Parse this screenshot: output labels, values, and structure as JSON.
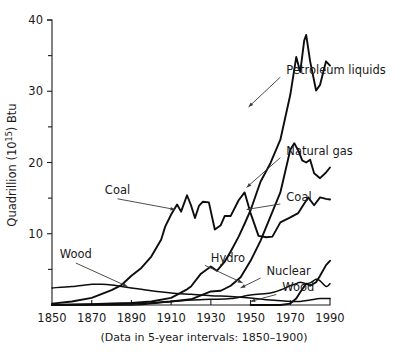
{
  "chart_data": {
    "type": "line",
    "title": "",
    "subtitle": "",
    "xlabel": "",
    "ylabel": "Quadrillion (10^15) Btu",
    "ylabel_parts": {
      "prefix": "Quadrillion (10",
      "exponent": "15",
      "suffix": ") Btu"
    },
    "caption": "(Data in 5-year intervals:  1850–1900)",
    "xlim": [
      1850,
      1990
    ],
    "ylim": [
      0,
      40
    ],
    "xticks": [
      1850,
      1870,
      1890,
      1910,
      1930,
      1950,
      1970,
      1990
    ],
    "xticklabels": [
      "1850",
      "1870",
      "1890",
      "1910",
      "1930",
      "1950",
      "1970",
      "1990"
    ],
    "yticks": [
      10,
      20,
      30,
      40
    ],
    "yticklabels": [
      "10",
      "20",
      "30",
      "40"
    ],
    "yminorticks": [
      5,
      15,
      25,
      35
    ],
    "grid": false,
    "legend_position": "inline-annotations",
    "line_color": "#0d0d0d",
    "axis_color": "#1c1c1c",
    "series": [
      {
        "name": "Wood",
        "x": [
          1850,
          1860,
          1870,
          1875,
          1880,
          1885,
          1890,
          1895,
          1900,
          1910,
          1920,
          1930,
          1940,
          1950,
          1960,
          1970,
          1975,
          1980,
          1985,
          1990
        ],
        "values": [
          2.4,
          2.6,
          2.9,
          2.9,
          2.8,
          2.6,
          2.4,
          2.2,
          2.0,
          1.7,
          1.5,
          1.3,
          1.2,
          1.0,
          0.7,
          0.5,
          0.5,
          0.7,
          0.9,
          0.9
        ]
      },
      {
        "name": "Coal",
        "x": [
          1850,
          1860,
          1870,
          1880,
          1885,
          1890,
          1895,
          1900,
          1905,
          1907,
          1910,
          1913,
          1915,
          1918,
          1920,
          1922,
          1924,
          1926,
          1929,
          1932,
          1935,
          1937,
          1940,
          1944,
          1947,
          1950,
          1954,
          1958,
          1961,
          1965,
          1970,
          1974,
          1976,
          1979,
          1982,
          1985,
          1988,
          1990
        ],
        "values": [
          0.2,
          0.5,
          1.0,
          2.1,
          2.8,
          4.1,
          5.2,
          6.8,
          9.2,
          11.0,
          12.7,
          14.1,
          13.1,
          15.4,
          14.0,
          12.2,
          13.9,
          14.5,
          14.4,
          10.6,
          11.2,
          12.5,
          12.5,
          14.7,
          15.8,
          12.9,
          9.7,
          9.5,
          9.6,
          11.6,
          12.3,
          12.9,
          13.8,
          15.1,
          14.0,
          15.1,
          14.9,
          14.8
        ]
      },
      {
        "name": "Petroleum liquids",
        "x": [
          1850,
          1870,
          1880,
          1890,
          1900,
          1910,
          1918,
          1920,
          1925,
          1930,
          1933,
          1937,
          1940,
          1944,
          1947,
          1950,
          1955,
          1960,
          1965,
          1970,
          1973,
          1975,
          1977,
          1978,
          1980,
          1983,
          1985,
          1988,
          1990
        ],
        "values": [
          0.0,
          0.1,
          0.2,
          0.3,
          0.5,
          1.0,
          2.2,
          2.6,
          4.4,
          5.4,
          4.8,
          6.1,
          7.5,
          9.6,
          11.4,
          13.3,
          17.3,
          19.9,
          23.2,
          29.5,
          34.8,
          32.7,
          37.1,
          37.9,
          34.2,
          30.1,
          30.9,
          34.2,
          33.6
        ]
      },
      {
        "name": "Natural gas",
        "x": [
          1850,
          1880,
          1890,
          1900,
          1910,
          1920,
          1930,
          1935,
          1940,
          1945,
          1950,
          1955,
          1960,
          1965,
          1970,
          1972,
          1974,
          1976,
          1978,
          1980,
          1982,
          1985,
          1988,
          1990
        ],
        "values": [
          0.0,
          0.1,
          0.2,
          0.3,
          0.5,
          0.8,
          1.9,
          2.0,
          2.7,
          3.9,
          6.2,
          9.0,
          12.4,
          15.8,
          21.8,
          22.7,
          21.7,
          20.3,
          20.0,
          20.4,
          18.5,
          17.8,
          18.6,
          19.3
        ]
      },
      {
        "name": "Hydro",
        "x": [
          1850,
          1890,
          1900,
          1910,
          1920,
          1930,
          1940,
          1950,
          1960,
          1965,
          1970,
          1973,
          1975,
          1978,
          1980,
          1983,
          1985,
          1988,
          1990
        ],
        "values": [
          0.0,
          0.0,
          0.2,
          0.5,
          0.7,
          0.8,
          0.9,
          1.4,
          1.7,
          2.1,
          2.7,
          3.0,
          3.2,
          3.0,
          3.1,
          3.6,
          3.4,
          2.6,
          3.0
        ]
      },
      {
        "name": "Nuclear",
        "x": [
          1950,
          1960,
          1965,
          1970,
          1973,
          1975,
          1978,
          1980,
          1983,
          1985,
          1988,
          1990
        ],
        "values": [
          0.0,
          0.0,
          0.0,
          0.2,
          0.9,
          1.8,
          3.0,
          2.7,
          3.2,
          4.1,
          5.6,
          6.2
        ]
      }
    ],
    "annotations": [
      {
        "label": "Coal",
        "side": "left",
        "text_x": 1883,
        "text_y": 15.6,
        "point_x": 1912,
        "point_y": 13.4
      },
      {
        "label": "Wood",
        "side": "left",
        "text_x": 1862,
        "text_y": 6.6,
        "point_x": 1888,
        "point_y": 2.6
      },
      {
        "label": "Petroleum liquids",
        "side": "right",
        "text_x": 1968,
        "text_y": 32.4,
        "point_x": 1949,
        "point_y": 27.8
      },
      {
        "label": "Natural gas",
        "side": "right",
        "text_x": 1968,
        "text_y": 21.1,
        "point_x": 1948,
        "point_y": 16.5
      },
      {
        "label": "Coal",
        "side": "right",
        "text_x": 1968,
        "text_y": 14.6,
        "point_x": 1948,
        "point_y": 13.4
      },
      {
        "label": "Hydro",
        "side": "right",
        "text_x": 1930,
        "text_y": 6.0,
        "point_x": 1946,
        "point_y": 3.1
      },
      {
        "label": "Nuclear",
        "side": "right",
        "text_x": 1958,
        "text_y": 4.2,
        "point_x": 1945,
        "point_y": 2.4
      },
      {
        "label": "Wood",
        "side": "right",
        "text_x": 1966,
        "text_y": 1.9,
        "point_x": 1950,
        "point_y": 0.5
      }
    ]
  }
}
